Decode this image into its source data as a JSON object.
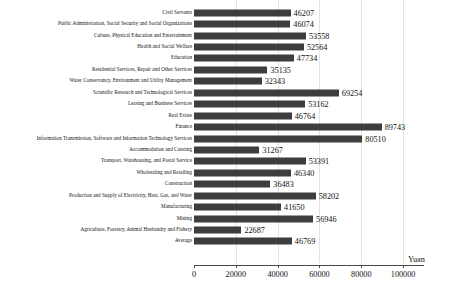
{
  "chart_data": {
    "type": "bar",
    "orientation": "horizontal",
    "title": "",
    "xlabel": "Yuan",
    "ylabel": "",
    "xlim": [
      0,
      110000
    ],
    "grid": true,
    "legend": null,
    "tick_labels": [
      "0",
      "20000",
      "40000",
      "60000",
      "80000",
      "100000"
    ],
    "ticks": [
      0,
      20000,
      40000,
      60000,
      80000,
      100000
    ],
    "bar_color": "#3d3d3d",
    "categories": [
      "Civil Servants",
      "Public Administration, Social Security and Social Organizations",
      "Culture, Physical Education and Entertainment",
      "Health and Social Welfare",
      "Education",
      "Residential Services, Repair and Other Services",
      "Water Conservancy, Environment and Utility Management",
      "Scientific Research and Technological Services",
      "Leasing and Business Services",
      "Real Estate",
      "Finance",
      "Information Transmission, Software and Information Technology Services",
      "Accommodation and Catering",
      "Transport, Warehousing, and Postal Service",
      "Wholesaling and Retailing",
      "Construction",
      "Production and Supply of Electricity, Heat, Gas, and Water",
      "Manufacturing",
      "Mining",
      "Agriculture, Forestry, Animal Husbandry and Fishery",
      "Average"
    ],
    "values": [
      46207,
      46074,
      53558,
      52564,
      47734,
      35135,
      32343,
      69254,
      53162,
      46764,
      89743,
      80510,
      31267,
      53391,
      46340,
      36483,
      58202,
      41650,
      56946,
      22687,
      46769
    ]
  }
}
